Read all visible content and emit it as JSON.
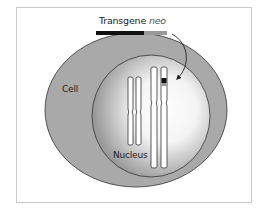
{
  "diagram": {
    "title_prefix": "Transgene",
    "title_gene": "neo",
    "labels": {
      "cell": "Cell",
      "nucleus": "Nucleus"
    },
    "transgene_bar": {
      "segments": [
        {
          "color": "#111111",
          "fraction": 0.67
        },
        {
          "color": "#999999",
          "fraction": 0.33
        }
      ]
    },
    "colors": {
      "cell_fill": "#a9a9a9",
      "nucleus_fill_center": "#ffffff",
      "nucleus_fill_edge": "#9a9a9a",
      "outline": "#333333",
      "frame": "#c8c8c8",
      "insert_band": "#111111",
      "insert_band_light": "#9a9a9a"
    },
    "chromosomes": [
      {
        "name": "short chromosome pair",
        "has_insertion": false
      },
      {
        "name": "long chromosome pair",
        "has_insertion": true
      }
    ],
    "arrow": "curved arrow from transgene into long chromosome"
  }
}
